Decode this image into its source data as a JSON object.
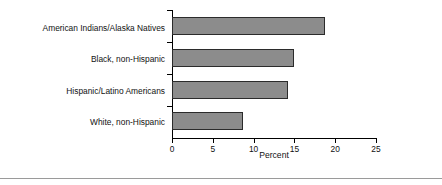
{
  "chart_data": {
    "type": "bar",
    "orientation": "horizontal",
    "title": "",
    "xlabel": "Percent",
    "ylabel": "",
    "categories": [
      "American Indians/Alaska Natives",
      "Black, non-Hispanic",
      "Hispanic/Latino Americans",
      "White, non-Hispanic"
    ],
    "values": [
      18.8,
      15.0,
      14.2,
      8.7
    ],
    "xlim": [
      0,
      25
    ],
    "ylim": [
      0,
      4
    ],
    "xticks": [
      0,
      5,
      10,
      15,
      20,
      25
    ],
    "xticklabels": [
      "0",
      "5",
      "10",
      "15",
      "20",
      "25"
    ],
    "grid": false,
    "legend": null,
    "colors": {
      "bar_fill": "#8c8c8c",
      "bar_edge": "#2b2b2b",
      "axis": "#000000",
      "text": "#111111",
      "rule": "#9a9a9a",
      "background": "#ffffff"
    }
  }
}
